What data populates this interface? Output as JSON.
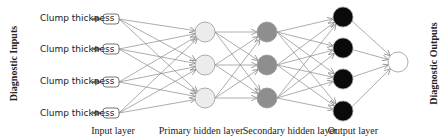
{
  "diagram": {
    "side_labels": {
      "left": "Diagnostic Inputs",
      "right": "Diagnostic Outputs"
    },
    "inputs": [
      {
        "label": "Clump thickness"
      },
      {
        "label": "Clump thickness"
      },
      {
        "label": "Clump thickness"
      },
      {
        "label": "Clump thickness"
      }
    ],
    "layer_labels": {
      "input": "Input layer",
      "primary_hidden": "Primary hidden layer",
      "secondary_hidden": "Secondary hidden layer",
      "output": "Output layer"
    },
    "colors": {
      "input_node": "#ffffff",
      "primary_hidden_node": "#ececec",
      "secondary_hidden_node": "#8e8e8e",
      "output_node": "#0a0a0a",
      "final_node": "#ffffff",
      "edge": "#8a8a8a"
    }
  }
}
